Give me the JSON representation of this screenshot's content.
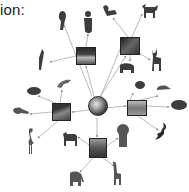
{
  "heading": {
    "text": "ion:"
  },
  "center": {
    "label": "Earth",
    "icon": "globe-icon"
  },
  "habitats": [
    {
      "id": "rainforest",
      "icon": "rainforest-icon",
      "x": 76,
      "y": 47,
      "w": 20,
      "h": 18
    },
    {
      "id": "forest",
      "icon": "forest-icon",
      "x": 120,
      "y": 37,
      "w": 20,
      "h": 18
    },
    {
      "id": "wetland",
      "icon": "wetland-icon",
      "x": 52,
      "y": 103,
      "w": 19,
      "h": 18
    },
    {
      "id": "ocean",
      "icon": "ocean-icon",
      "x": 127,
      "y": 100,
      "w": 20,
      "h": 16
    },
    {
      "id": "savanna",
      "icon": "savanna-icon",
      "x": 89,
      "y": 138,
      "w": 18,
      "h": 20
    }
  ],
  "animals": [
    {
      "name": "parrot",
      "x": 55,
      "y": 12
    },
    {
      "name": "monkey",
      "x": 82,
      "y": 10
    },
    {
      "name": "toucan",
      "x": 38,
      "y": 50
    },
    {
      "name": "squirrel",
      "x": 104,
      "y": 5
    },
    {
      "name": "moose",
      "x": 143,
      "y": 4
    },
    {
      "name": "bear",
      "x": 120,
      "y": 62
    },
    {
      "name": "deer",
      "x": 150,
      "y": 50
    },
    {
      "name": "dolphin",
      "x": 57,
      "y": 78
    },
    {
      "name": "beaver",
      "x": 28,
      "y": 88
    },
    {
      "name": "platypus",
      "x": 13,
      "y": 108
    },
    {
      "name": "flamingo",
      "x": 27,
      "y": 128
    },
    {
      "name": "frog",
      "x": 135,
      "y": 80
    },
    {
      "name": "seal",
      "x": 157,
      "y": 83
    },
    {
      "name": "turtle",
      "x": 170,
      "y": 100
    },
    {
      "name": "scorpion",
      "x": 155,
      "y": 125
    },
    {
      "name": "zebra",
      "x": 62,
      "y": 132
    },
    {
      "name": "lion",
      "x": 117,
      "y": 126
    },
    {
      "name": "elephant",
      "x": 68,
      "y": 172
    },
    {
      "name": "giraffe",
      "x": 112,
      "y": 163
    }
  ],
  "colors": {
    "line": "#8a8a8a",
    "silhouette": "#3d3d3d",
    "box": "#3a3a3a"
  }
}
